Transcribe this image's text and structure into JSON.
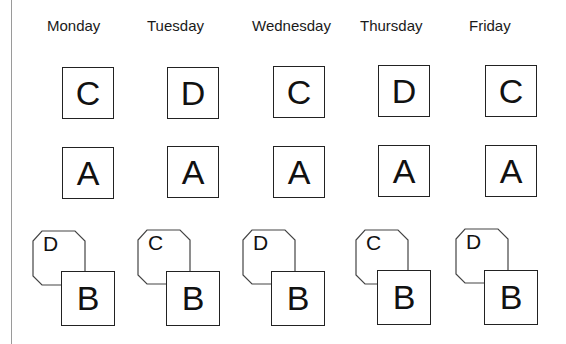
{
  "days": [
    "Monday",
    "Tuesday",
    "Wednesday",
    "Thursday",
    "Friday"
  ],
  "row1": [
    "C",
    "D",
    "C",
    "D",
    "C"
  ],
  "row2": [
    "A",
    "A",
    "A",
    "A",
    "A"
  ],
  "row3_back": [
    "D",
    "C",
    "D",
    "C",
    "D"
  ],
  "row3_front": [
    "B",
    "B",
    "B",
    "B",
    "B"
  ]
}
